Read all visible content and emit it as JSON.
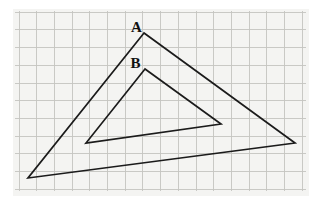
{
  "figure": {
    "background": "#ffffff",
    "stroke_color": "#1b1b1b",
    "stroke_width": 1.7,
    "panel": {
      "x": 13,
      "y": 9,
      "width": 296,
      "height": 187,
      "bg": "#f4f4f2"
    },
    "grid": {
      "color": "#c4c4c0",
      "width": 0.9,
      "x0": 19,
      "sx": 17.7,
      "cols": 17,
      "y0": 12.2,
      "sy": 17.7,
      "rows": 11,
      "x_left": 15,
      "x_right": 306,
      "y_top": 11,
      "y_bot": 191
    },
    "triangles": [
      {
        "name": "large-triangle",
        "label": "A",
        "points": "144,33 28,178 295,143",
        "label_x": 136.5,
        "label_y": 31.5
      },
      {
        "name": "small-triangle",
        "label": "B",
        "points": "145,69 86,143 221,124",
        "label_x": 135.5,
        "label_y": 67.5
      }
    ]
  }
}
